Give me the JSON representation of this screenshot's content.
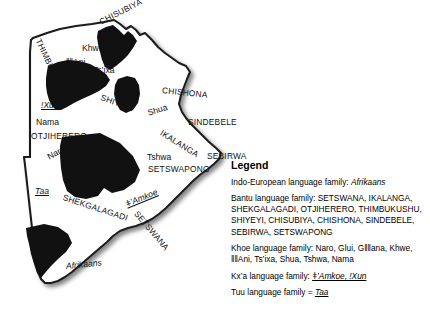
{
  "figure": {
    "colors": {
      "land_fill": "#ffffff",
      "border_stroke": "#1a1a1a",
      "region_fill": "#111111",
      "shadow": "#8c8c8c",
      "text": "#111111"
    }
  },
  "map_labels": [
    {
      "id": "chisubiya",
      "text": "CHISUBIYA",
      "family": "bantu",
      "x": 100,
      "y": 18,
      "rotate": -27
    },
    {
      "id": "thimbukushu",
      "text": "THIMBUKUSHU",
      "family": "bantu",
      "x": 38,
      "y": 35,
      "rotate": 65
    },
    {
      "id": "khwe",
      "text": "Khwe",
      "family": "khoe",
      "x": 82,
      "y": 44,
      "rotate": 0
    },
    {
      "id": "ani",
      "text": "ǁǁAni",
      "family": "khoe",
      "x": 66,
      "y": 58,
      "rotate": 0
    },
    {
      "id": "tsixa",
      "text": "Ts’ixa",
      "family": "khoe",
      "x": 93,
      "y": 66,
      "rotate": 0
    },
    {
      "id": "shiyeyi",
      "text": "SHIYEYI",
      "family": "bantu",
      "x": 101,
      "y": 93,
      "rotate": 20
    },
    {
      "id": "chishona",
      "text": "CHISHONA",
      "family": "bantu",
      "x": 162,
      "y": 86,
      "rotate": 6
    },
    {
      "id": "shua",
      "text": "Shua",
      "family": "khoe",
      "x": 148,
      "y": 109,
      "rotate": -18
    },
    {
      "id": "sindebele",
      "text": "SINDEBELE",
      "family": "bantu",
      "x": 188,
      "y": 118,
      "rotate": 0
    },
    {
      "id": "xun",
      "text": "ǃXun",
      "family": "kxa",
      "x": 41,
      "y": 101,
      "rotate": 0
    },
    {
      "id": "nama",
      "text": "Nama",
      "family": "khoe",
      "x": 36,
      "y": 118,
      "rotate": 0
    },
    {
      "id": "otjiherero",
      "text": "OTJIHERERO",
      "family": "bantu",
      "x": 31,
      "y": 132,
      "rotate": 0
    },
    {
      "id": "gllana",
      "text": "Gǁǁana",
      "family": "khoe",
      "x": 66,
      "y": 145,
      "rotate": 0
    },
    {
      "id": "naro",
      "text": "Naro",
      "family": "khoe",
      "x": 48,
      "y": 153,
      "rotate": -28
    },
    {
      "id": "ikalanga",
      "text": "IKALANGA",
      "family": "bantu",
      "x": 161,
      "y": 128,
      "rotate": 32
    },
    {
      "id": "tshwa",
      "text": "Tshwa",
      "family": "khoe",
      "x": 147,
      "y": 153,
      "rotate": 0
    },
    {
      "id": "setswapong",
      "text": "SETSWAPONG",
      "family": "bantu",
      "x": 148,
      "y": 165,
      "rotate": 0
    },
    {
      "id": "sebirwa",
      "text": "SEBIRWA",
      "family": "bantu",
      "x": 207,
      "y": 152,
      "rotate": 0
    },
    {
      "id": "gui",
      "text": "Gǀui",
      "family": "khoe",
      "x": 67,
      "y": 178,
      "rotate": 0
    },
    {
      "id": "taa",
      "text": "Taa",
      "family": "tuu",
      "x": 35,
      "y": 187,
      "rotate": 0
    },
    {
      "id": "shekgalagadi",
      "text": "SHEKGALAGADI",
      "family": "bantu",
      "x": 63,
      "y": 193,
      "rotate": 18
    },
    {
      "id": "amkoe",
      "text": "ǂ’Amkoe",
      "family": "kxa",
      "x": 126,
      "y": 200,
      "rotate": -22
    },
    {
      "id": "setswana",
      "text": "SETSWANA",
      "family": "bantu",
      "x": 136,
      "y": 208,
      "rotate": 50
    },
    {
      "id": "afrikaans",
      "text": "Afrikaans",
      "family": "indo",
      "x": 66,
      "y": 262,
      "rotate": -6
    }
  ],
  "legend": {
    "title": "Legend",
    "rows": [
      {
        "id": "indo-european",
        "prefix": "Indo-European language family: ",
        "items_style": "italic",
        "items": "Afrikaans"
      },
      {
        "id": "bantu",
        "prefix": "Bantu language family: ",
        "items_style": "plain",
        "items": "SETSWANA, IKALANGA, SHEKGALAGADI, OTJIHERERO, THIMBUKUSHU, SHIYEYI, CHISUBIYA, CHISHONA, SINDEBELE, SEBIRWA, SETSWAPONG"
      },
      {
        "id": "khoe",
        "prefix": "Khoe language family: ",
        "items_style": "plain",
        "items": "Naro, Gǀui, Gǁǁana, Khwe, ǁǁAni, Ts’ixa, Shua, Tshwa, Nama"
      },
      {
        "id": "kxa",
        "prefix": "Kx’a language family: ",
        "items_style": "italic-underline",
        "items": "ǂ’Amkoe, ǃXun"
      },
      {
        "id": "tuu",
        "prefix": "Tuu language family = ",
        "items_style": "italic-underline",
        "items": "Taa"
      }
    ]
  }
}
